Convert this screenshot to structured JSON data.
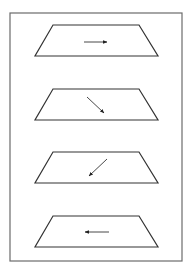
{
  "figure": {
    "frame": {
      "x": 10,
      "y": 13,
      "width": 172,
      "height": 248,
      "stroke": "#6b6b6b"
    },
    "line_color": "#333333",
    "panels": [
      {
        "id": 1,
        "arrow_direction": "right",
        "top_y": 25,
        "bottom_y": 56,
        "arrow": {
          "x1": 84,
          "y1": 42,
          "x2": 107,
          "y2": 42
        }
      },
      {
        "id": 2,
        "arrow_direction": "down-right",
        "top_y": 89,
        "bottom_y": 120,
        "arrow": {
          "x1": 87,
          "y1": 97,
          "x2": 104,
          "y2": 113
        }
      },
      {
        "id": 3,
        "arrow_direction": "down-left",
        "top_y": 152,
        "bottom_y": 183,
        "arrow": {
          "x1": 107,
          "y1": 159,
          "x2": 89,
          "y2": 176
        }
      },
      {
        "id": 4,
        "arrow_direction": "left",
        "top_y": 216,
        "bottom_y": 247,
        "arrow": {
          "x1": 109,
          "y1": 232,
          "x2": 85,
          "y2": 232
        }
      }
    ],
    "trapezoid": {
      "top_left_x": 53,
      "top_right_x": 139,
      "bottom_left_x": 35,
      "bottom_right_x": 158
    }
  }
}
